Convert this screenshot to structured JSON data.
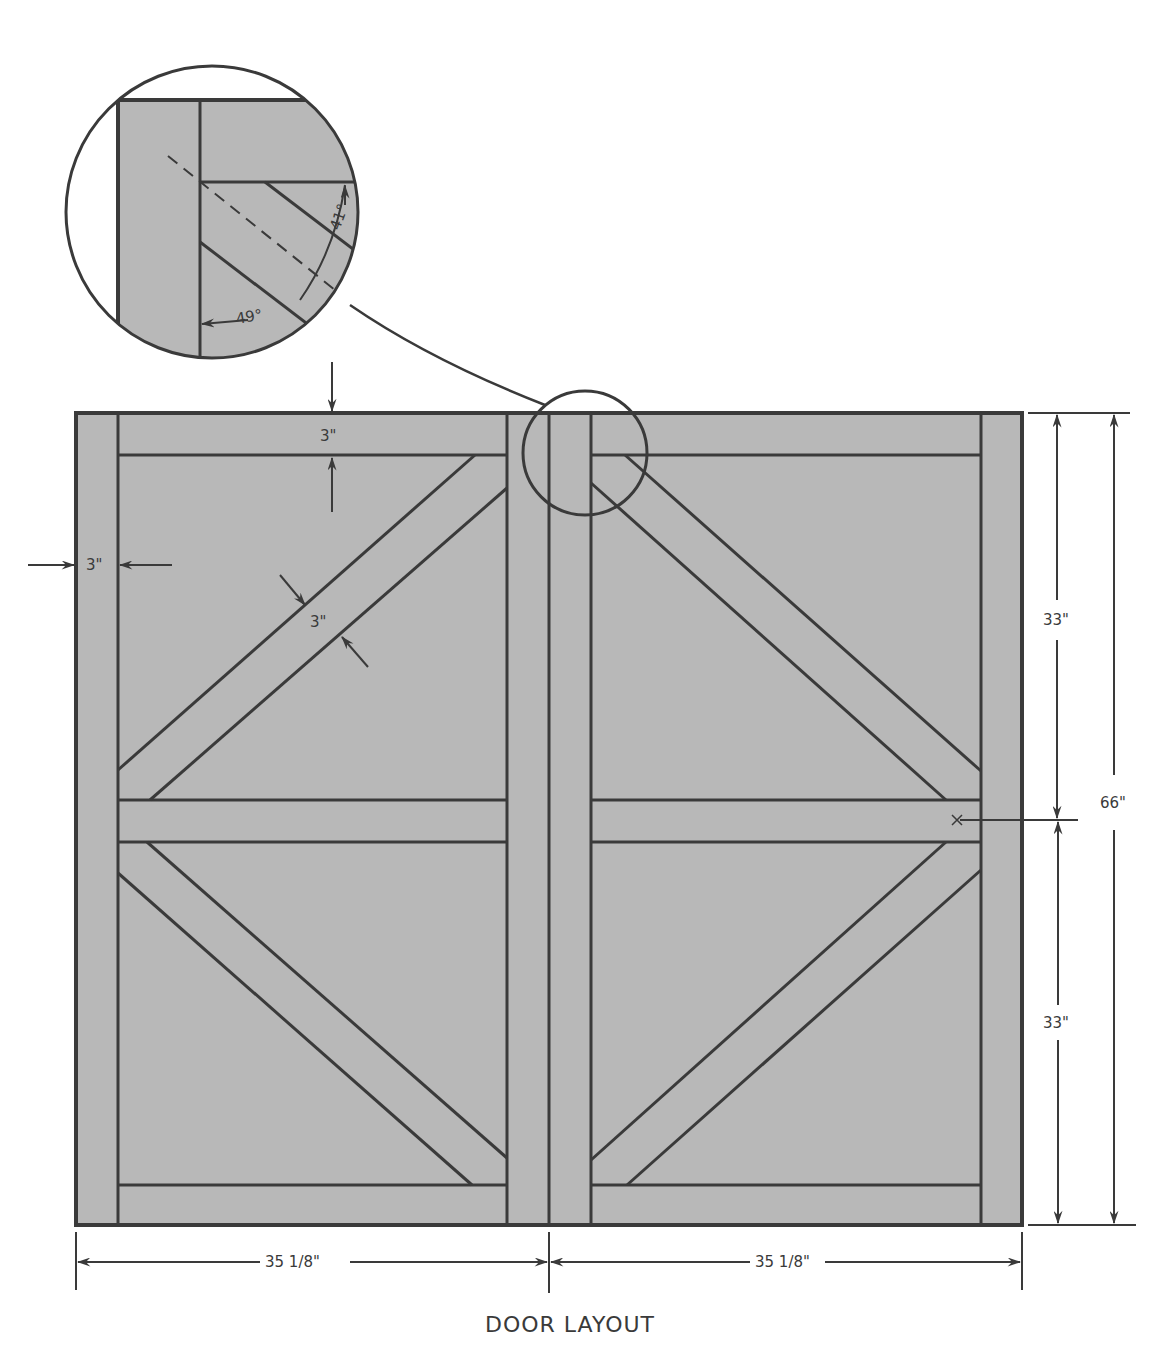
{
  "title": "DOOR LAYOUT",
  "colors": {
    "panel_fill": "#b8b8b8",
    "line": "#3a3a3a",
    "background": "#ffffff"
  },
  "dimensions": {
    "top_rail_width": "3\"",
    "stile_width": "3\"",
    "brace_width": "3\"",
    "upper_half_height": "33\"",
    "lower_half_height": "33\"",
    "total_height": "66\"",
    "left_door_width": "35 1/8\"",
    "right_door_width": "35 1/8\""
  },
  "detail": {
    "angle_upper": "41°",
    "angle_lower": "49°"
  }
}
